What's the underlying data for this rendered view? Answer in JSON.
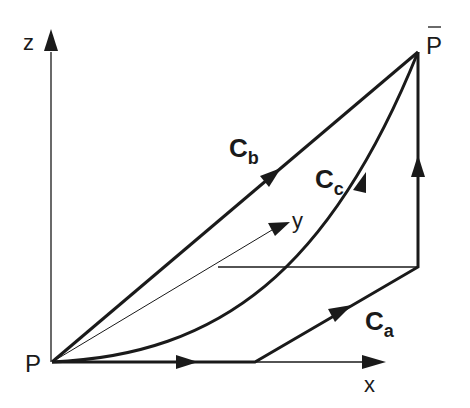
{
  "diagram": {
    "type": "3d-path-integration",
    "colors": {
      "ink": "#1a1a1a",
      "background": "#ffffff"
    },
    "axes": {
      "x": {
        "label": "x"
      },
      "y": {
        "label": "y"
      },
      "z": {
        "label": "z"
      }
    },
    "points": {
      "start": {
        "label": "P"
      },
      "end": {
        "label": "P",
        "overbar": true
      }
    },
    "curves": [
      {
        "id": "a",
        "label": "C",
        "subscript": "a",
        "description": "piecewise path: along x, then along y, then up z"
      },
      {
        "id": "b",
        "label": "C",
        "subscript": "b",
        "description": "straight line from P to P-bar"
      },
      {
        "id": "c",
        "label": "C",
        "subscript": "c",
        "description": "curved path from P to P-bar"
      }
    ]
  }
}
